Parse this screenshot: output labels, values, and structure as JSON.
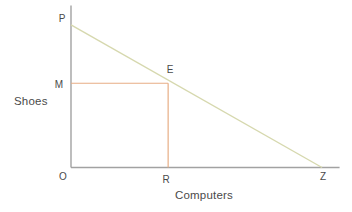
{
  "chart_data": {
    "type": "line",
    "title": "",
    "xlabel": "Computers",
    "ylabel": "Shoes",
    "grid": false,
    "legend": false,
    "axis_color": "#a2a2a2",
    "label_color": "#4a4a4a",
    "xlim": [
      0,
      10.7
    ],
    "ylim": [
      0,
      10
    ],
    "series": [
      {
        "name": "budget-line",
        "color": "#d6d8ae",
        "x": [
          0,
          10
        ],
        "y": [
          8.8,
          0
        ]
      }
    ],
    "reference_lines": [
      {
        "name": "M-E",
        "color": "#e7ad85",
        "from": [
          0,
          5.2
        ],
        "to": [
          3.87,
          5.2
        ]
      },
      {
        "name": "E-R",
        "color": "#e7ad85",
        "from": [
          3.87,
          5.2
        ],
        "to": [
          3.87,
          0
        ]
      }
    ],
    "points": [
      {
        "label": "P",
        "x": 0,
        "y": 8.8
      },
      {
        "label": "M",
        "x": 0,
        "y": 5.2
      },
      {
        "label": "E",
        "x": 3.87,
        "y": 5.39
      },
      {
        "label": "O",
        "x": 0,
        "y": 0
      },
      {
        "label": "R",
        "x": 3.87,
        "y": 0
      },
      {
        "label": "Z",
        "x": 10,
        "y": 0
      }
    ]
  }
}
